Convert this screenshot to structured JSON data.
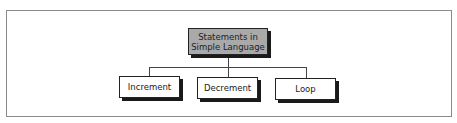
{
  "diagram": {
    "root": {
      "label": "Statements in Simple Language",
      "fill": "#a9a9a9"
    },
    "children": [
      {
        "label": "Increment"
      },
      {
        "label": "Decrement"
      },
      {
        "label": "Loop"
      }
    ]
  }
}
